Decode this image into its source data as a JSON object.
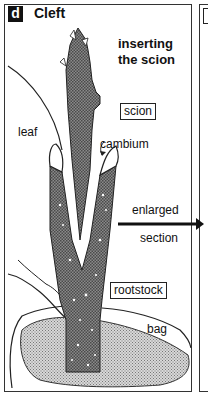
{
  "panel": {
    "letter": "d",
    "title": "Cleft",
    "heading_line1": "inserting",
    "heading_line2": "the scion"
  },
  "labels": {
    "scion": "scion",
    "leaf": "leaf",
    "cambium": "cambium",
    "arrow_line1": "enlarged",
    "arrow_line2": "section",
    "rootstock": "rootstock",
    "bag": "bag"
  },
  "colors": {
    "ink": "#111111",
    "stem_fill": "#6e6e6e",
    "bag_fill": "#bdbdbd",
    "background": "#ffffff"
  }
}
